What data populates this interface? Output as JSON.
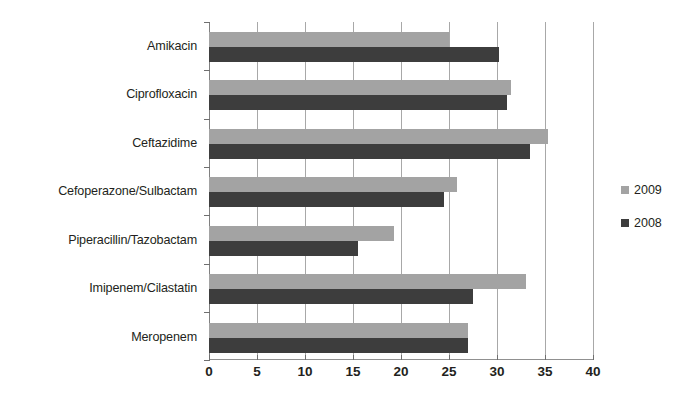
{
  "chart_data": {
    "type": "bar",
    "orientation": "horizontal",
    "title": "",
    "xlabel": "",
    "ylabel": "",
    "xlim": [
      0,
      40
    ],
    "xticks": [
      0,
      5,
      10,
      15,
      20,
      25,
      30,
      35,
      40
    ],
    "xtick_labels": [
      "0",
      "5",
      "10",
      "15",
      "20",
      "25",
      "30",
      "35",
      "40"
    ],
    "grid": true,
    "legend_position": "right",
    "categories": [
      "Amikacin",
      "Ciprofloxacin",
      "Ceftazidime",
      "Cefoperazone/Sulbactam",
      "Piperacillin/Tazobactam",
      "Imipenem/Cilastatin",
      "Meropenem"
    ],
    "series": [
      {
        "name": "2009",
        "color": "#a3a3a3",
        "values": [
          25.0,
          31.5,
          35.3,
          25.8,
          19.3,
          33.0,
          27.0
        ]
      },
      {
        "name": "2008",
        "color": "#3d3d3d",
        "values": [
          30.2,
          31.0,
          33.4,
          24.5,
          15.5,
          27.5,
          27.0
        ]
      }
    ]
  },
  "legend": {
    "entries": [
      {
        "label": "2009",
        "color": "#a3a3a3"
      },
      {
        "label": "2008",
        "color": "#3d3d3d"
      }
    ]
  }
}
